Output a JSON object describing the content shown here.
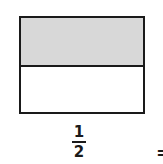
{
  "diagram": {
    "type": "fraction-model",
    "shape": "rectangle",
    "total_parts": 2,
    "shaded_parts": 1,
    "parts": [
      {
        "position": "top",
        "shaded": true,
        "color": "#d8d8d8"
      },
      {
        "position": "bottom",
        "shaded": false,
        "color": "#ffffff"
      }
    ],
    "outline_color": "#1a1a1a"
  },
  "fraction": {
    "numerator": "1",
    "denominator": "2"
  },
  "operator": {
    "symbol": "="
  }
}
